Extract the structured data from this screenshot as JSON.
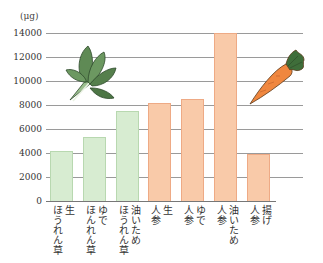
{
  "chart_data": {
    "type": "bar",
    "title": "",
    "ylabel": "(μg)",
    "xlabel": "",
    "ylim": [
      0,
      14000
    ],
    "yticks": [
      "14000",
      "12000",
      "10000",
      "8000",
      "6000",
      "4000",
      "2000",
      "0"
    ],
    "grid": true,
    "categories": [
      "生 ほうれん草",
      "ゆで ほんれん草",
      "油いため ほうれん草",
      "生 人参",
      "ゆで 人参",
      "油いため 人参",
      "揚げ 人参"
    ],
    "category_lines": [
      [
        "生",
        "ほうれん草"
      ],
      [
        "ゆで",
        "ほんれん草"
      ],
      [
        "油いため",
        "ほうれん草"
      ],
      [
        "生",
        "人参"
      ],
      [
        "ゆで",
        "人参"
      ],
      [
        "油いため",
        "人参"
      ],
      [
        "揚げ",
        "人参"
      ]
    ],
    "series": [
      {
        "name": "ほうれん草",
        "color": "#d7ecd1",
        "values": [
          4200,
          5300,
          7500,
          null,
          null,
          null,
          null
        ]
      },
      {
        "name": "人参",
        "color": "#f9caa9",
        "values": [
          null,
          null,
          null,
          8200,
          8500,
          14000,
          3900
        ]
      }
    ],
    "values": [
      4200,
      5300,
      7500,
      8200,
      8500,
      14000,
      3900
    ],
    "bar_colors": [
      "#d7ecd1",
      "#d7ecd1",
      "#d7ecd1",
      "#f9caa9",
      "#f9caa9",
      "#f9caa9",
      "#f9caa9"
    ],
    "illustrations": [
      "spinach-illustration",
      "carrot-illustration"
    ]
  }
}
